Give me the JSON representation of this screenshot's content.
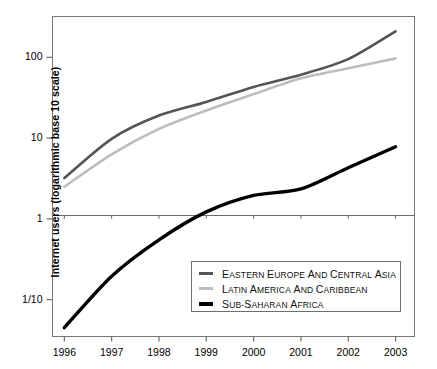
{
  "chart_data": {
    "type": "line",
    "title": "",
    "subtitle": "",
    "xlabel": "",
    "ylabel": "Internet users (logarithmic base 10 scale)",
    "x": [
      1996,
      1997,
      1998,
      1999,
      2000,
      2001,
      2002,
      2003
    ],
    "xtick_labels": [
      "1996",
      "1997",
      "1998",
      "1999",
      "2000",
      "2001",
      "2002",
      "2003"
    ],
    "ytick_labels": [
      "100",
      "10",
      "1",
      "1/10"
    ],
    "ytick_values": [
      100,
      10,
      1,
      0.1
    ],
    "yscale": "log10",
    "ylim": [
      0.035,
      320
    ],
    "xlim": [
      1995.75,
      2003.4
    ],
    "grid": false,
    "legend_position": "inside-bottom-center",
    "series": [
      {
        "name": "Eastern Europe and Central Asia",
        "color": "#555555",
        "width": 2.6,
        "values": [
          3.2,
          9.8,
          19.0,
          28.0,
          43.0,
          61.0,
          95.0,
          210.0
        ]
      },
      {
        "name": "Latin America and Caribbean",
        "color": "#bdbdbd",
        "width": 2.6,
        "values": [
          2.5,
          6.3,
          13.0,
          22.0,
          35.0,
          55.0,
          73.0,
          97.0
        ]
      },
      {
        "name": "Sub-Saharan Africa",
        "color": "#000000",
        "width": 3.4,
        "values": [
          0.045,
          0.195,
          0.55,
          1.22,
          1.95,
          2.35,
          4.3,
          7.8
        ]
      }
    ]
  },
  "axes": {
    "y_title": "Internet users (logarithmic base 10 scale)",
    "y_ticks": [
      {
        "label": "100",
        "value": 100
      },
      {
        "label": "10",
        "value": 10
      },
      {
        "label": "1",
        "value": 1
      },
      {
        "label": "1/10",
        "value": 0.1
      }
    ],
    "x_ticks": [
      {
        "label": "1996"
      },
      {
        "label": "1997"
      },
      {
        "label": "1998"
      },
      {
        "label": "1999"
      },
      {
        "label": "2000"
      },
      {
        "label": "2001"
      },
      {
        "label": "2002"
      },
      {
        "label": "2003"
      }
    ]
  },
  "legend": {
    "items": [
      {
        "label": "Eastern Europe and Central Asia",
        "color": "#555555",
        "thick": false
      },
      {
        "label": "Latin America and Caribbean",
        "color": "#bdbdbd",
        "thick": false
      },
      {
        "label": "Sub-Saharan Africa",
        "color": "#000000",
        "thick": true
      }
    ]
  },
  "caption": {
    "text": ""
  }
}
